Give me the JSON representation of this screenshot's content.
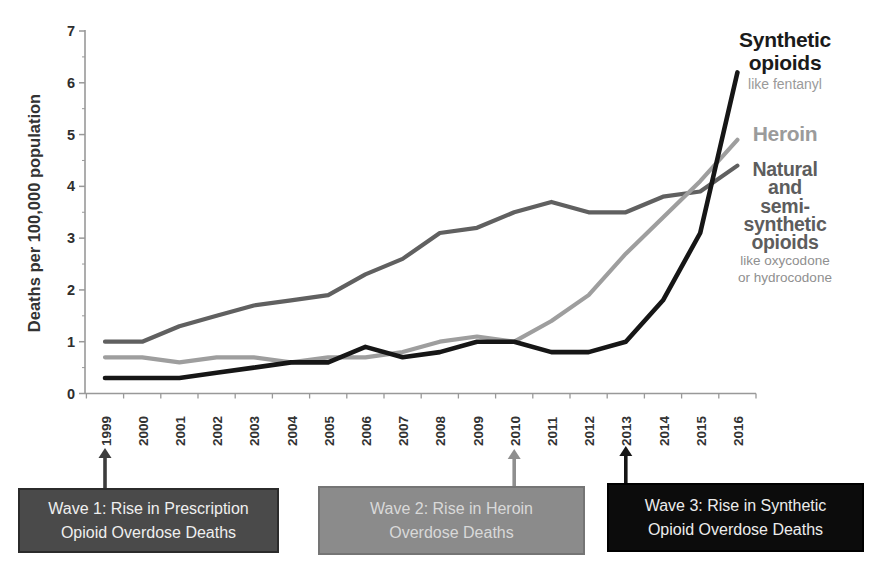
{
  "chart_data": {
    "type": "line",
    "title": "",
    "xlabel": "",
    "ylabel": "Deaths per 100,000 population",
    "ylim": [
      0,
      7
    ],
    "yticks": [
      0,
      1,
      2,
      3,
      4,
      5,
      6,
      7
    ],
    "grid": false,
    "legend_position": "right",
    "x": [
      1999,
      2000,
      2001,
      2002,
      2003,
      2004,
      2005,
      2006,
      2007,
      2008,
      2009,
      2010,
      2011,
      2012,
      2013,
      2014,
      2015,
      2016
    ],
    "series": [
      {
        "name": "Synthetic opioids",
        "note": "like fentanyl",
        "color": "#161616",
        "values": [
          0.3,
          0.3,
          0.3,
          0.4,
          0.5,
          0.6,
          0.6,
          0.9,
          0.7,
          0.8,
          1.0,
          1.0,
          0.8,
          0.8,
          1.0,
          1.8,
          3.1,
          6.2
        ]
      },
      {
        "name": "Heroin",
        "note": "",
        "color": "#9e9e9e",
        "values": [
          0.7,
          0.7,
          0.6,
          0.7,
          0.7,
          0.6,
          0.7,
          0.7,
          0.8,
          1.0,
          1.1,
          1.0,
          1.4,
          1.9,
          2.7,
          3.4,
          4.1,
          4.9
        ]
      },
      {
        "name": "Natural and semi-synthetic opioids",
        "note": "like oxycodone or hydrocodone",
        "color": "#606060",
        "values": [
          1.0,
          1.0,
          1.3,
          1.5,
          1.7,
          1.8,
          1.9,
          2.3,
          2.6,
          3.1,
          3.2,
          3.5,
          3.7,
          3.5,
          3.5,
          3.8,
          3.9,
          4.4
        ]
      }
    ]
  },
  "axis": {
    "color": "#999999",
    "tick_label_color": "#2e2e2e",
    "ylabel_color": "#333333"
  },
  "legend": {
    "synthetic": {
      "lines": [
        "Synthetic",
        "opioids"
      ],
      "note": "like fentanyl",
      "color": "#1a1a1a",
      "note_color": "#9a9a9a"
    },
    "heroin": {
      "lines": [
        "Heroin"
      ],
      "color": "#9b9b9b"
    },
    "natural": {
      "lines": [
        "Natural",
        "and",
        "semi-",
        "synthetic",
        "opioids"
      ],
      "note_lines": [
        "like oxycodone",
        "or hydrocodone"
      ],
      "color": "#5d5d5d",
      "note_color": "#8f8f8f"
    }
  },
  "waves": [
    {
      "label": "Wave 1: Rise in Prescription Opioid Overdose Deaths",
      "arrow_year": 1999,
      "bg": "#4a4a4a",
      "fg": "#efefef",
      "border": "#2b2b2b",
      "arrow_color": "#3c3c3c"
    },
    {
      "label": "Wave 2: Rise in Heroin Overdose Deaths",
      "arrow_year": 2010,
      "bg": "#8b8b8b",
      "fg": "#d9d9d9",
      "border": "#757575",
      "arrow_color": "#8f8f8f"
    },
    {
      "label": "Wave 3: Rise in Synthetic Opioid Overdose Deaths",
      "arrow_year": 2013,
      "bg": "#0c0c0c",
      "fg": "#ececec",
      "border": "#000000",
      "arrow_color": "#161616"
    }
  ]
}
